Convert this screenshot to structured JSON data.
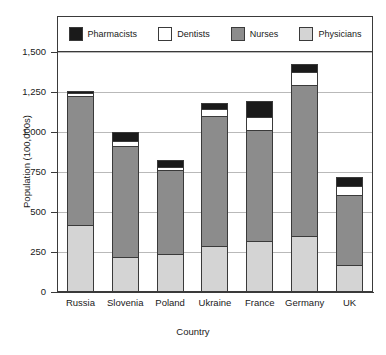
{
  "chart_data": {
    "type": "bar",
    "stacked": true,
    "title": "",
    "xlabel": "Country",
    "ylabel": "Population (100,000s)",
    "ylim": [
      0,
      1500
    ],
    "yticks": [
      0,
      250,
      500,
      750,
      1000,
      1250,
      1500
    ],
    "ytick_labels": [
      "0",
      "250",
      "500",
      "750",
      "1,000",
      "1,250",
      "1,500"
    ],
    "grid": true,
    "legend_position": "top",
    "categories": [
      "Russia",
      "Slovenia",
      "Poland",
      "Ukraine",
      "France",
      "Germany",
      "UK"
    ],
    "series": [
      {
        "name": "Physicians",
        "color": "#d4d4d4",
        "values": [
          415,
          215,
          230,
          280,
          315,
          345,
          160
        ]
      },
      {
        "name": "Nurses",
        "color": "#8c8c8c",
        "values": [
          805,
          690,
          525,
          815,
          690,
          940,
          440
        ]
      },
      {
        "name": "Dentists",
        "color": "#ffffff",
        "values": [
          15,
          35,
          20,
          45,
          85,
          85,
          55
        ]
      },
      {
        "name": "Pharmacists",
        "color": "#1a1a1a",
        "values": [
          20,
          60,
          50,
          40,
          105,
          55,
          65
        ]
      }
    ],
    "totals": [
      1255,
      1000,
      825,
      1180,
      1195,
      1425,
      720
    ],
    "legend_order": [
      "Pharmacists",
      "Dentists",
      "Nurses",
      "Physicians"
    ]
  },
  "legend": {
    "items": [
      {
        "label": "Pharmacists",
        "color": "#1a1a1a"
      },
      {
        "label": "Dentists",
        "color": "#ffffff"
      },
      {
        "label": "Nurses",
        "color": "#8c8c8c"
      },
      {
        "label": "Physicians",
        "color": "#d4d4d4"
      }
    ]
  },
  "axes": {
    "y_title": "Population (100,000s)",
    "x_title": "Country",
    "y_ticks": [
      "1,500",
      "1,250",
      "1,000",
      "750",
      "500",
      "250",
      "0"
    ],
    "x_ticks": [
      "Russia",
      "Slovenia",
      "Poland",
      "Ukraine",
      "France",
      "Germany",
      "UK"
    ]
  }
}
